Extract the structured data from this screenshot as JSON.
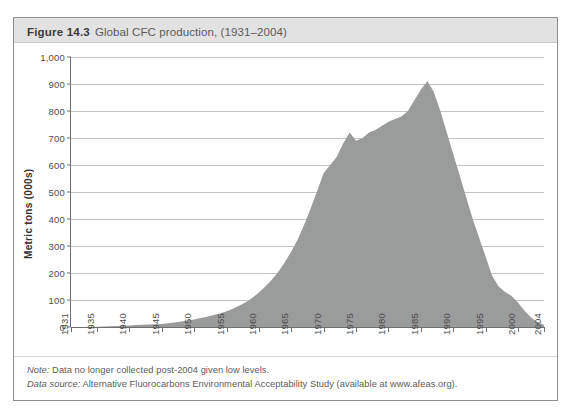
{
  "figure": {
    "number": "Figure 14.3",
    "caption": "Global CFC production, (1931–2004)"
  },
  "notes": {
    "note_lead": "Note:",
    "note_text": " Data no longer collected post-2004 given low levels.",
    "source_lead": "Data source:",
    "source_text": " Alternative Fluorocarbons Environmental Acceptability Study (available at www.afeas.org)."
  },
  "colors": {
    "area_fill": "#9a9b9b",
    "grid": "#c4c4c4",
    "axis": "#6f6f6f",
    "title_band": "#e2e2e2",
    "frame": "#8e8e8e"
  },
  "chart_data": {
    "type": "area",
    "title": "Global CFC production, (1931–2004)",
    "xlabel": "",
    "ylabel": "Metric tons (000s)",
    "xlim": [
      1931,
      2004
    ],
    "ylim": [
      0,
      1000
    ],
    "ytick_labels": [
      "1,000",
      "900",
      "800",
      "700",
      "600",
      "500",
      "400",
      "300",
      "200",
      "100",
      "0"
    ],
    "yticks": [
      1000,
      900,
      800,
      700,
      600,
      500,
      400,
      300,
      200,
      100,
      0
    ],
    "xtick_labels": [
      "1931",
      "1935",
      "1940",
      "1945",
      "1950",
      "1955",
      "1960",
      "1965",
      "1970",
      "1975",
      "1980",
      "1985",
      "1990",
      "1995",
      "2000",
      "2004"
    ],
    "xticks": [
      1931,
      1935,
      1940,
      1945,
      1950,
      1955,
      1960,
      1965,
      1970,
      1975,
      1980,
      1985,
      1990,
      1995,
      2000,
      2004
    ],
    "grid": true,
    "legend": null,
    "x": [
      1931,
      1932,
      1933,
      1934,
      1935,
      1936,
      1937,
      1938,
      1939,
      1940,
      1941,
      1942,
      1943,
      1944,
      1945,
      1946,
      1947,
      1948,
      1949,
      1950,
      1951,
      1952,
      1953,
      1954,
      1955,
      1956,
      1957,
      1958,
      1959,
      1960,
      1961,
      1962,
      1963,
      1964,
      1965,
      1966,
      1967,
      1968,
      1969,
      1970,
      1971,
      1972,
      1973,
      1974,
      1975,
      1976,
      1977,
      1978,
      1979,
      1980,
      1981,
      1982,
      1983,
      1984,
      1985,
      1986,
      1987,
      1988,
      1989,
      1990,
      1991,
      1992,
      1993,
      1994,
      1995,
      1996,
      1997,
      1998,
      1999,
      2000,
      2001,
      2002,
      2003,
      2004
    ],
    "values": [
      0,
      0,
      0,
      1,
      1,
      2,
      3,
      4,
      5,
      6,
      7,
      8,
      9,
      10,
      11,
      14,
      17,
      20,
      24,
      28,
      33,
      38,
      44,
      50,
      58,
      68,
      80,
      92,
      108,
      128,
      150,
      175,
      205,
      240,
      280,
      325,
      380,
      440,
      505,
      570,
      600,
      630,
      680,
      720,
      690,
      700,
      720,
      730,
      745,
      760,
      770,
      780,
      800,
      840,
      880,
      910,
      870,
      800,
      720,
      640,
      560,
      480,
      400,
      330,
      260,
      190,
      150,
      130,
      115,
      90,
      60,
      35,
      18,
      8
    ],
    "peak": {
      "year": 1986,
      "value": 910
    },
    "series_name": "Global CFC production"
  }
}
